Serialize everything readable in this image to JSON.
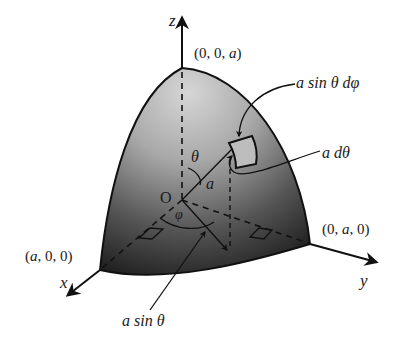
{
  "figure": {
    "type": "spherical-surface-element",
    "colors": {
      "surface_light": "#c8c8c8",
      "surface_dark": "#2a2a2a",
      "line": "#111111",
      "background": "#ffffff"
    }
  },
  "axes": {
    "z_label": "z",
    "x_label": "x",
    "y_label": "y"
  },
  "points": {
    "top": "(0, 0, a)",
    "x_intercept": "(a, 0, 0)",
    "y_intercept": "(0, a, 0)",
    "origin": "O"
  },
  "angles": {
    "theta": "θ",
    "phi": "φ"
  },
  "annotations": {
    "radius": "a",
    "arc_phi": "a sin θ dφ",
    "arc_theta": "a dθ",
    "projection": "a sin θ"
  }
}
